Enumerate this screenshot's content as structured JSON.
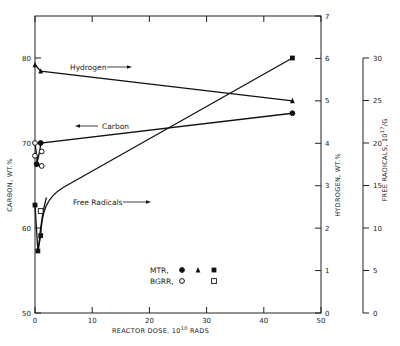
{
  "chart_data": {
    "type": "scatter",
    "title": "",
    "xlabel": "REACTOR DOSE, 10^10 RADS",
    "xlabel_base": "REACTOR DOSE, 10",
    "xlabel_sup": "10",
    "xlabel_tail": " RADS",
    "xlim": [
      0,
      50
    ],
    "xticks": [
      0,
      10,
      20,
      30,
      40,
      50
    ],
    "axes": {
      "carbon": {
        "label": "CARBON, WT.%",
        "lim": [
          50,
          85
        ],
        "ticks": [
          50,
          60,
          70,
          80
        ],
        "side": "left"
      },
      "hydrogen": {
        "label": "HYDROGEN, WT.%",
        "lim": [
          0,
          7
        ],
        "ticks": [
          0,
          1,
          2,
          3,
          4,
          5,
          6,
          7
        ],
        "side": "right"
      },
      "free_radicals": {
        "label_base": "FREE RADICALS, 10",
        "label_sup": "17",
        "label_tail": "/G",
        "lim": [
          0,
          30
        ],
        "ticks": [
          0,
          5,
          10,
          15,
          20,
          25,
          30
        ],
        "side": "far-right"
      }
    },
    "grid": false,
    "series": [
      {
        "name": "Hydrogen",
        "reactor": "MTR",
        "marker": "triangle-filled",
        "axis": "hydrogen",
        "points": [
          [
            0,
            5.85
          ],
          [
            1,
            5.7
          ],
          [
            45,
            5.0
          ]
        ]
      },
      {
        "name": "Carbon",
        "reactor": "MTR",
        "marker": "circle-filled",
        "axis": "carbon",
        "points": [
          [
            0.3,
            67.5
          ],
          [
            1,
            70.0
          ],
          [
            45,
            73.5
          ]
        ]
      },
      {
        "name": "Carbon",
        "reactor": "BGRR",
        "marker": "circle-open",
        "axis": "carbon",
        "points": [
          [
            0,
            70.0
          ],
          [
            0,
            68.5
          ],
          [
            1,
            69.0
          ],
          [
            1,
            67.3
          ]
        ]
      },
      {
        "name": "Free Radicals",
        "reactor": "MTR",
        "marker": "square-filled",
        "axis": "free_radicals",
        "points": [
          [
            0,
            12.7
          ],
          [
            0.5,
            7.3
          ],
          [
            1,
            9.1
          ],
          [
            45,
            30.0
          ]
        ]
      },
      {
        "name": "Free Radicals",
        "reactor": "BGRR",
        "marker": "square-open",
        "axis": "free_radicals",
        "points": [
          [
            1,
            12.0
          ]
        ]
      }
    ],
    "annotations": [
      {
        "text": "Hydrogen",
        "arrow": "right"
      },
      {
        "text": "Carbon",
        "arrow": "left"
      },
      {
        "text": "Free Radicals",
        "arrow": "right"
      }
    ],
    "legend": {
      "placement": "lower-center",
      "rows": [
        {
          "label": "MTR,",
          "markers": [
            "circle-filled",
            "triangle-filled",
            "square-filled"
          ]
        },
        {
          "label": "BGRR,",
          "markers": [
            "circle-open",
            "",
            "square-open"
          ]
        }
      ]
    }
  }
}
